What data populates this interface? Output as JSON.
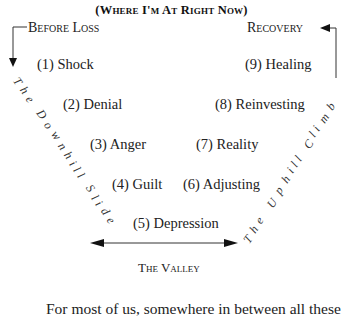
{
  "title": "(Where I'm At Right Now)",
  "labels": {
    "start": "Before Loss",
    "end": "Recovery",
    "bottom": "The Valley"
  },
  "left_side": {
    "label": "The Downhill Slide",
    "stages": [
      {
        "num": "(1)",
        "name": "Shock",
        "text": "(1) Shock"
      },
      {
        "num": "(2)",
        "name": "Denial",
        "text": "(2) Denial"
      },
      {
        "num": "(3)",
        "name": "Anger",
        "text": "(3) Anger"
      },
      {
        "num": "(4)",
        "name": "Guilt",
        "text": "(4) Guilt"
      }
    ]
  },
  "bottom_stage": {
    "num": "(5)",
    "name": "Depression",
    "text": "(5) Depression"
  },
  "right_side": {
    "label": "The Uphill Climb",
    "stages": [
      {
        "num": "(6)",
        "name": "Adjusting",
        "text": "(6) Adjusting"
      },
      {
        "num": "(7)",
        "name": "Reality",
        "text": "(7) Reality"
      },
      {
        "num": "(8)",
        "name": "Reinvesting",
        "text": "(8) Reinvesting"
      },
      {
        "num": "(9)",
        "name": "Healing",
        "text": "(9) Healing"
      }
    ]
  },
  "diagonal_letters": {
    "left": [
      "T",
      "h",
      "e",
      "D",
      "o",
      "w",
      "n",
      "h",
      "i",
      "l",
      "l",
      "S",
      "l",
      "i",
      "d",
      "e"
    ],
    "right": [
      "T",
      "h",
      "e",
      "U",
      "p",
      "h",
      "i",
      "l",
      "l",
      "C",
      "l",
      "i",
      "m",
      "b"
    ]
  },
  "paragraph": "For most of us, somewhere in between all these"
}
